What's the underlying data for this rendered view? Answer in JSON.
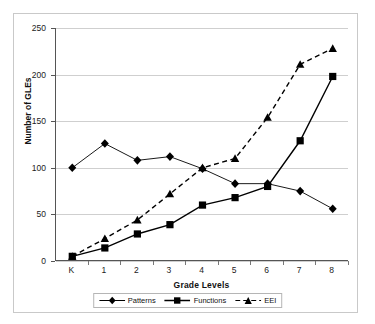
{
  "chart_data": {
    "type": "line",
    "title": "",
    "xlabel": "Grade Levels",
    "ylabel": "Number of GLEs",
    "categories": [
      "K",
      "1",
      "2",
      "3",
      "4",
      "5",
      "6",
      "7",
      "8"
    ],
    "ylim": [
      0,
      250
    ],
    "yticks": [
      0,
      50,
      100,
      150,
      200,
      250
    ],
    "grid": "horizontal",
    "legend_position": "bottom",
    "series": [
      {
        "name": "Patterns",
        "marker": "diamond",
        "linestyle": "solid-thin",
        "color": "#000000",
        "values": [
          100,
          126,
          108,
          112,
          99,
          83,
          83,
          75,
          56
        ]
      },
      {
        "name": "Functions",
        "marker": "square",
        "linestyle": "solid",
        "color": "#000000",
        "values": [
          5,
          14,
          29,
          39,
          60,
          68,
          80,
          129,
          198
        ]
      },
      {
        "name": "EEI",
        "marker": "triangle",
        "linestyle": "dashed",
        "color": "#000000",
        "values": [
          5,
          24,
          44,
          72,
          100,
          110,
          154,
          211,
          228
        ]
      }
    ]
  },
  "axes": {
    "y_tick_labels": [
      "250",
      "200",
      "150",
      "100",
      "50",
      "0"
    ],
    "x_tick_labels": [
      "K",
      "1",
      "2",
      "3",
      "4",
      "5",
      "6",
      "7",
      "8"
    ],
    "x_title": "Grade Levels",
    "y_title": "Number of GLEs"
  },
  "legend": {
    "items": [
      {
        "label": "Patterns",
        "marker": "diamond",
        "line": "solid"
      },
      {
        "label": "Functions",
        "marker": "square",
        "line": "solid"
      },
      {
        "label": "EEI",
        "marker": "triangle",
        "line": "dashed"
      }
    ]
  }
}
